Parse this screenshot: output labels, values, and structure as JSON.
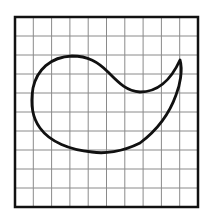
{
  "figure": {
    "grid": {
      "columns": 10,
      "rows": 10,
      "x": 15,
      "y": 17,
      "width": 183,
      "height": 190,
      "line_color": "#8a8a8a",
      "border_color": "#111111"
    },
    "shape": {
      "name": "paisley-curve",
      "stroke_color": "#111111",
      "path": "M 72 56 C 88 56, 98 62, 108 72 C 118 82, 126 91, 140 92 C 156 92, 170 82, 180 60 C 183 70, 180 85, 176 95 C 170 112, 160 128, 140 143 C 122 152, 104 154, 92 152 C 70 150, 50 142, 40 128 C 31 116, 31 100, 33 88 C 37 70, 50 57, 72 56 Z"
    }
  }
}
